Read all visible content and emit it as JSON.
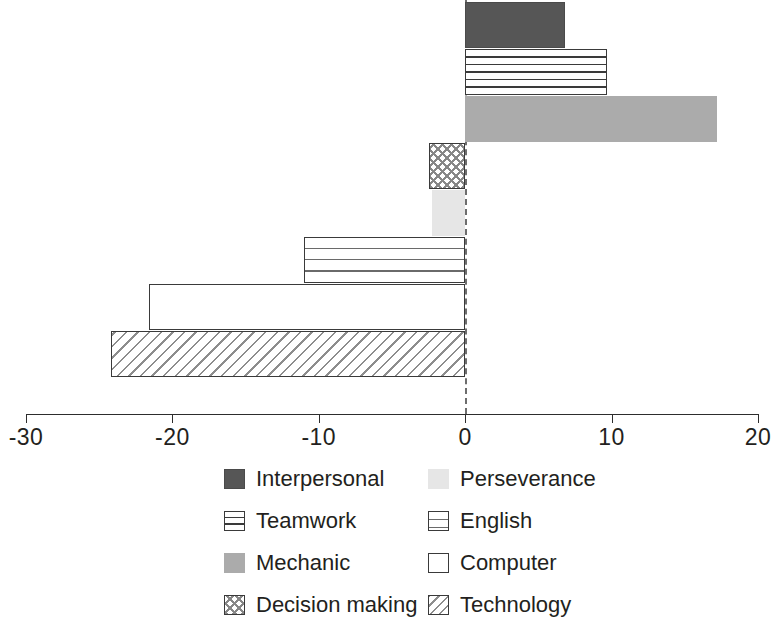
{
  "chart_data": {
    "type": "bar",
    "orientation": "horizontal",
    "title": "",
    "subtitle": "",
    "xlabel": "",
    "ylabel": "",
    "xlim": [
      -30,
      20
    ],
    "xticks": [
      -30,
      -20,
      -10,
      0,
      10,
      20
    ],
    "xtick_labels": [
      "-30",
      "-20",
      "-10",
      "0",
      "10",
      "20"
    ],
    "grid": false,
    "zero_reference_line": true,
    "legend_position": "bottom",
    "legend_columns": 2,
    "categories": [
      "Interpersonal",
      "Teamwork",
      "Mechanic",
      "Decision making",
      "Perseverance",
      "English",
      "Computer",
      "Technology"
    ],
    "values": [
      6.8,
      9.7,
      17.2,
      -2.5,
      -2.3,
      -11.0,
      -21.6,
      -24.2
    ],
    "bars": [
      {
        "label": "Interpersonal",
        "value": 6.8,
        "fill": "solid-dark",
        "swatch": "solid-dark"
      },
      {
        "label": "Teamwork",
        "value": 9.7,
        "fill": "hlines",
        "swatch": "hlines"
      },
      {
        "label": "Mechanic",
        "value": 17.2,
        "fill": "solid-mid",
        "swatch": "solid-mid"
      },
      {
        "label": "Decision making",
        "value": -2.5,
        "fill": "check",
        "swatch": "check"
      },
      {
        "label": "Perseverance",
        "value": -2.3,
        "fill": "verylight",
        "swatch": "verylight"
      },
      {
        "label": "English",
        "value": -11.0,
        "fill": "grid",
        "swatch": "grid"
      },
      {
        "label": "Computer",
        "value": -21.6,
        "fill": "white",
        "swatch": "white"
      },
      {
        "label": "Technology",
        "value": -24.2,
        "fill": "diag",
        "swatch": "diag"
      }
    ],
    "colors": {
      "solid_dark": "#565656",
      "solid_mid": "#ababab",
      "very_light": "#e6e6e6",
      "outline": "#3a3a3a",
      "axis": "#2d2d2d",
      "text": "#231f20",
      "background": "#ffffff"
    }
  },
  "legend": {
    "column_left": [
      {
        "label": "Interpersonal",
        "swatch": "solid-dark"
      },
      {
        "label": "Teamwork",
        "swatch": "hlines"
      },
      {
        "label": "Mechanic",
        "swatch": "solid-mid"
      },
      {
        "label": "Decision making",
        "swatch": "check"
      }
    ],
    "column_right": [
      {
        "label": "Perseverance",
        "swatch": "verylight"
      },
      {
        "label": "English",
        "swatch": "grid"
      },
      {
        "label": "Computer",
        "swatch": "white"
      },
      {
        "label": "Technology",
        "swatch": "diag"
      }
    ]
  }
}
